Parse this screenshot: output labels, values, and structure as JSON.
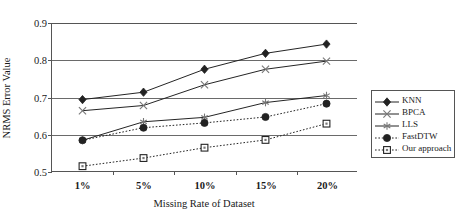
{
  "chart_data": {
    "type": "line",
    "title": "",
    "xlabel": "Missing Rate of Dataset",
    "ylabel": "NRMS Error Value",
    "categories": [
      "1%",
      "5%",
      "10%",
      "15%",
      "20%"
    ],
    "ylim": [
      0.5,
      0.9
    ],
    "yticks": [
      "0.5",
      "0.6",
      "0.7",
      "0.8",
      "0.9"
    ],
    "grid": true,
    "legend_position": "right",
    "series": [
      {
        "name": "KNN",
        "marker": "filled-diamond",
        "line_style": "solid",
        "color": "#222222",
        "values": [
          0.693,
          0.713,
          0.775,
          0.818,
          0.843
        ]
      },
      {
        "name": "BPCA",
        "marker": "cross-x",
        "line_style": "solid",
        "color": "#222222",
        "values": [
          0.663,
          0.677,
          0.733,
          0.775,
          0.797
        ]
      },
      {
        "name": "LLS",
        "marker": "asterisk",
        "line_style": "solid",
        "color": "#222222",
        "values": [
          0.583,
          0.633,
          0.645,
          0.685,
          0.704
        ]
      },
      {
        "name": "FastDTW",
        "marker": "filled-circle",
        "line_style": "dotted",
        "color": "#222222",
        "values": [
          0.583,
          0.617,
          0.63,
          0.646,
          0.682
        ]
      },
      {
        "name": "Our approach",
        "marker": "open-square",
        "line_style": "dotted",
        "color": "#222222",
        "values": [
          0.513,
          0.535,
          0.563,
          0.584,
          0.628
        ]
      }
    ]
  }
}
